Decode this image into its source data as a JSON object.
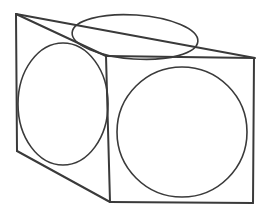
{
  "figure": {
    "type": "line-drawing",
    "canvas": {
      "width": 272,
      "height": 214
    },
    "colors": {
      "background": "#ffffff",
      "edge_stroke": "#3a3a3a",
      "curve_stroke": "#3a3a3a",
      "fill": "none"
    },
    "stroke_widths": {
      "edge": 2.0,
      "curve": 1.6
    },
    "vertices": {
      "top_back_left": {
        "x": 16,
        "y": 14
      },
      "top_back_right": {
        "x": 255,
        "y": 58
      },
      "top_front_left": {
        "x": 106,
        "y": 56
      },
      "front_top_right": {
        "x": 254,
        "y": 58
      },
      "front_bottom_right": {
        "x": 253,
        "y": 203
      },
      "front_bottom_left": {
        "x": 110,
        "y": 202
      },
      "left_bottom_back": {
        "x": 17,
        "y": 151
      },
      "left_top_back": {
        "x": 16,
        "y": 14
      }
    },
    "edges": [
      {
        "name": "top-face-back-left-edge",
        "path": "M 16 14 L 106 56"
      },
      {
        "name": "top-face-back-right-edge",
        "path": "M 16 14 L 255 58"
      },
      {
        "name": "top-face-front-edge",
        "path": "M 106 56 L 254 58"
      },
      {
        "name": "left-face-back-vertical-edge",
        "path": "M 16 14 L 17 151"
      },
      {
        "name": "left-face-bottom-edge",
        "path": "M 17 151 L 110 202"
      },
      {
        "name": "front-face-left-vertical-edge",
        "path": "M 106 56 L 110 202"
      },
      {
        "name": "front-face-bottom-edge",
        "path": "M 110 202 L 253 203"
      },
      {
        "name": "front-face-right-vertical-edge",
        "path": "M 254 58 L 253 203"
      }
    ],
    "shapes": [
      {
        "name": "top-face-ellipse",
        "face": "top",
        "kind": "ellipse",
        "cx": 135,
        "cy": 37,
        "rx": 63,
        "ry": 22,
        "rotation_deg": 4
      },
      {
        "name": "left-face-ellipse",
        "face": "left",
        "kind": "ellipse",
        "cx": 63,
        "cy": 104,
        "rx": 45,
        "ry": 61,
        "rotation_deg": 0
      },
      {
        "name": "front-face-circle",
        "face": "front",
        "kind": "circle",
        "cx": 182,
        "cy": 132,
        "rx": 65,
        "ry": 65,
        "rotation_deg": 0
      }
    ]
  }
}
